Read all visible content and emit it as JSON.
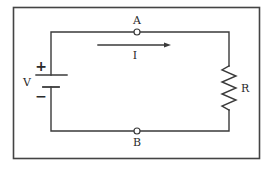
{
  "diagram": {
    "title": "",
    "type": "circuit-schematic",
    "colors": {
      "wire": "#3a3a3a",
      "frame": "#444444",
      "text": "#2a2a2a",
      "background": "#ffffff"
    },
    "labels": {
      "voltage_source": "V",
      "positive_terminal": "+",
      "negative_terminal": "−",
      "resistor": "R",
      "current": "I",
      "node_top": "A",
      "node_bottom": "B"
    },
    "components": [
      {
        "id": "battery",
        "kind": "voltage-source",
        "label": "V",
        "position": "left branch"
      },
      {
        "id": "resistor",
        "kind": "resistor",
        "label": "R",
        "position": "right branch"
      },
      {
        "id": "node-a",
        "kind": "terminal",
        "label": "A",
        "position": "top wire"
      },
      {
        "id": "node-b",
        "kind": "terminal",
        "label": "B",
        "position": "bottom wire"
      },
      {
        "id": "current-arrow",
        "kind": "current-direction",
        "label": "I",
        "direction": "left-to-right along top wire"
      }
    ]
  }
}
